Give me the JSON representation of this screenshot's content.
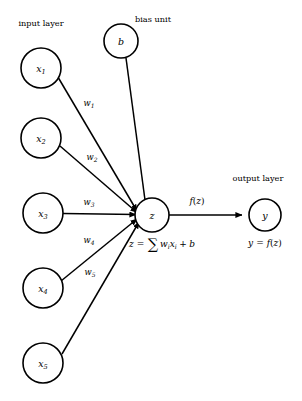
{
  "diagram": {
    "background_color": "#ffffff",
    "stroke_color": "#000000",
    "labels": {
      "input_layer": "input layer",
      "bias_unit": "bias unit",
      "output_layer": "output layer"
    },
    "input_nodes": [
      {
        "id": "x1",
        "base": "x",
        "sub": "1",
        "cx": 41,
        "cy": 68,
        "r": 20
      },
      {
        "id": "x2",
        "base": "x",
        "sub": "2",
        "cx": 41,
        "cy": 138,
        "r": 20
      },
      {
        "id": "x3",
        "base": "x",
        "sub": "3",
        "cx": 43,
        "cy": 213,
        "r": 20
      },
      {
        "id": "x4",
        "base": "x",
        "sub": "4",
        "cx": 43,
        "cy": 288,
        "r": 20
      },
      {
        "id": "x5",
        "base": "x",
        "sub": "5",
        "cx": 43,
        "cy": 363,
        "r": 20
      }
    ],
    "bias_node": {
      "id": "b",
      "base": "b",
      "sub": "",
      "cx": 121,
      "cy": 41,
      "r": 17
    },
    "sum_node": {
      "id": "z",
      "base": "z",
      "sub": "",
      "cx": 152,
      "cy": 215,
      "r": 17
    },
    "output_node": {
      "id": "y",
      "base": "y",
      "sub": "",
      "cx": 265,
      "cy": 215,
      "r": 16
    },
    "weights": [
      {
        "id": "w1",
        "base": "w",
        "sub": "1",
        "x": 89,
        "y": 106
      },
      {
        "id": "w2",
        "base": "w",
        "sub": "2",
        "x": 92,
        "y": 160
      },
      {
        "id": "w3",
        "base": "w",
        "sub": "3",
        "x": 89,
        "y": 205
      },
      {
        "id": "w4",
        "base": "w",
        "sub": "4",
        "x": 89,
        "y": 243
      },
      {
        "id": "w5",
        "base": "w",
        "sub": "5",
        "x": 90,
        "y": 275
      }
    ],
    "activation_edge_label": {
      "id": "fz",
      "text": "f(z)",
      "func": "f",
      "open": "(",
      "arg": "z",
      "close": ")",
      "x": 197,
      "y": 204
    },
    "sum_formula": {
      "id": "z-formula",
      "text": "z = ∑ wᵢxᵢ + b",
      "lhs": "z",
      "equals": "=",
      "sigma": "∑",
      "w": "w",
      "w_sub": "i",
      "x": "x",
      "x_sub": "i",
      "plus": "+",
      "bias": "b",
      "pos_x": 162,
      "pos_y": 247
    },
    "output_formula": {
      "id": "y-formula",
      "text": "y = f(z)",
      "lhs": "y",
      "equals": "=",
      "func": "f",
      "open": "(",
      "arg": "z",
      "close": ")",
      "pos_x": 265,
      "pos_y": 246
    },
    "layer_label_positions": {
      "input_layer": {
        "x": 41,
        "y": 26
      },
      "bias_unit": {
        "x": 153,
        "y": 22
      },
      "output_layer": {
        "x": 258,
        "y": 181
      }
    }
  }
}
